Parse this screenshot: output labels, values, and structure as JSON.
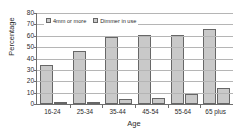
{
  "chart_data": {
    "type": "bar",
    "title": "",
    "xlabel": "Age",
    "ylabel": "Percentage",
    "categories": [
      "16-24",
      "25-34",
      "35-44",
      "45-54",
      "55-64",
      "65 plus"
    ],
    "series": [
      {
        "name": "4mm or more",
        "values": [
          34,
          47,
          58.5,
          61,
          61,
          66
        ]
      },
      {
        "name": "Dimmer in use",
        "values": [
          1,
          2,
          4.5,
          5,
          8.5,
          14
        ]
      }
    ],
    "ylim": [
      0,
      80
    ],
    "yticks": [
      0,
      10,
      20,
      30,
      40,
      50,
      60,
      70,
      80
    ],
    "grid": true,
    "legend_position": "top-left-inside",
    "colors": {
      "bar_fill": "#c9c9c9",
      "bar_stroke": "#676767",
      "gridline": "#b5b5b5",
      "axis": "#6e6e6e",
      "text": "#2b2b2b"
    }
  }
}
